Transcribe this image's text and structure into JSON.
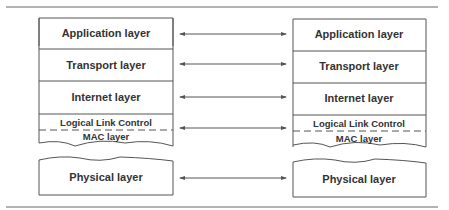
{
  "diagram": {
    "colors": {
      "stroke": "#555555",
      "text": "#333333",
      "rule": "#666666"
    },
    "left_stack": {
      "layers": [
        {
          "label": "Application layer"
        },
        {
          "label": "Transport layer"
        },
        {
          "label": "Internet layer"
        },
        {
          "label": "Logical Link Control"
        },
        {
          "label": "MAC layer"
        },
        {
          "label": "Physical layer"
        }
      ]
    },
    "right_stack": {
      "layers": [
        {
          "label": "Application layer"
        },
        {
          "label": "Transport layer"
        },
        {
          "label": "Internet layer"
        },
        {
          "label": "Logical Link Control"
        },
        {
          "label": "MAC layer"
        },
        {
          "label": "Physical layer"
        }
      ]
    },
    "connections": [
      {
        "from": "Application layer",
        "to": "Application layer",
        "type": "bidirectional"
      },
      {
        "from": "Transport layer",
        "to": "Transport layer",
        "type": "bidirectional"
      },
      {
        "from": "Internet layer",
        "to": "Internet layer",
        "type": "bidirectional"
      },
      {
        "from": "Logical Link Control / MAC layer",
        "to": "Logical Link Control / MAC layer",
        "type": "bidirectional"
      },
      {
        "from": "Physical layer",
        "to": "Physical layer",
        "type": "bidirectional"
      }
    ]
  }
}
